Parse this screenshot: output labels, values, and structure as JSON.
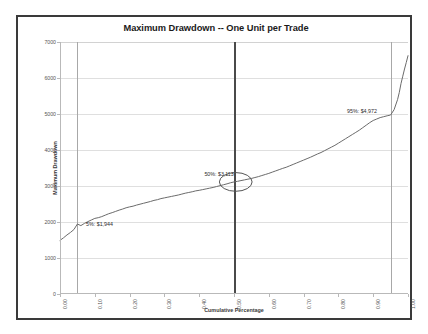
{
  "chart_data": {
    "type": "line",
    "title": "Maximum Drawdown -- One Unit per Trade",
    "xlabel": "Cumulative Percentage",
    "ylabel": "Maximum Drawdown",
    "xlim": [
      0.0,
      1.0
    ],
    "ylim": [
      0,
      7000
    ],
    "grid": true,
    "legend": "none",
    "xticks": [
      "0.00",
      "0.10",
      "0.20",
      "0.30",
      "0.40",
      "0.50",
      "0.60",
      "0.70",
      "0.80",
      "0.90",
      "1.00"
    ],
    "xtick_values": [
      0.0,
      0.1,
      0.2,
      0.3,
      0.4,
      0.5,
      0.6,
      0.7,
      0.8,
      0.9,
      1.0
    ],
    "yticks": [
      "0",
      "1000",
      "2000",
      "3000",
      "4000",
      "5000",
      "6000",
      "7000"
    ],
    "ytick_values": [
      0,
      1000,
      2000,
      3000,
      4000,
      5000,
      6000,
      7000
    ],
    "series": [
      {
        "name": "Maximum Drawdown",
        "color": "#6b6b6b",
        "x": [
          0.0,
          0.01,
          0.02,
          0.03,
          0.04,
          0.05,
          0.06,
          0.07,
          0.08,
          0.09,
          0.1,
          0.11,
          0.12,
          0.13,
          0.14,
          0.15,
          0.16,
          0.17,
          0.18,
          0.19,
          0.2,
          0.21,
          0.22,
          0.23,
          0.24,
          0.25,
          0.26,
          0.27,
          0.28,
          0.29,
          0.3,
          0.31,
          0.32,
          0.33,
          0.34,
          0.35,
          0.36,
          0.37,
          0.38,
          0.39,
          0.4,
          0.41,
          0.42,
          0.43,
          0.44,
          0.45,
          0.46,
          0.47,
          0.48,
          0.49,
          0.5,
          0.51,
          0.52,
          0.53,
          0.54,
          0.55,
          0.56,
          0.57,
          0.58,
          0.59,
          0.6,
          0.61,
          0.62,
          0.63,
          0.64,
          0.65,
          0.66,
          0.67,
          0.68,
          0.69,
          0.7,
          0.71,
          0.72,
          0.73,
          0.74,
          0.75,
          0.76,
          0.77,
          0.78,
          0.79,
          0.8,
          0.81,
          0.82,
          0.83,
          0.84,
          0.85,
          0.86,
          0.87,
          0.88,
          0.89,
          0.9,
          0.91,
          0.92,
          0.93,
          0.94,
          0.95,
          0.96,
          0.97,
          0.975,
          0.98,
          0.985,
          0.99,
          0.995,
          1.0
        ],
        "y": [
          1490,
          1560,
          1640,
          1710,
          1790,
          1944,
          1900,
          1960,
          2010,
          2055,
          2100,
          2120,
          2150,
          2190,
          2230,
          2260,
          2295,
          2330,
          2360,
          2395,
          2420,
          2440,
          2470,
          2495,
          2520,
          2545,
          2570,
          2600,
          2620,
          2650,
          2670,
          2690,
          2710,
          2730,
          2750,
          2775,
          2800,
          2820,
          2840,
          2865,
          2880,
          2900,
          2920,
          2940,
          2960,
          2985,
          3010,
          3035,
          3060,
          3090,
          3113,
          3130,
          3150,
          3170,
          3190,
          3210,
          3235,
          3260,
          3290,
          3320,
          3350,
          3385,
          3420,
          3455,
          3490,
          3520,
          3560,
          3600,
          3640,
          3680,
          3720,
          3760,
          3800,
          3845,
          3890,
          3930,
          3980,
          4030,
          4080,
          4130,
          4190,
          4250,
          4310,
          4370,
          4430,
          4490,
          4550,
          4620,
          4690,
          4760,
          4820,
          4860,
          4900,
          4925,
          4950,
          4972,
          5120,
          5400,
          5600,
          5850,
          6050,
          6250,
          6430,
          6620
        ]
      }
    ],
    "reference_lines": [
      {
        "name": "p5-line",
        "x": 0.05,
        "style": "thin",
        "color": "#a8a8a8"
      },
      {
        "name": "p50-line",
        "x": 0.5,
        "style": "thick",
        "color": "#4a4a4a"
      },
      {
        "name": "p95-line",
        "x": 0.95,
        "style": "thin",
        "color": "#a8a8a8"
      }
    ],
    "annotations": [
      {
        "name": "p5-annotation",
        "text": "5%: $1,944",
        "x": 0.075,
        "y": 2030,
        "percentile": 5,
        "value": 1944
      },
      {
        "name": "p50-annotation",
        "text": "50%: $3,113",
        "x": 0.415,
        "y": 3420,
        "percentile": 50,
        "value": 3113
      },
      {
        "name": "p95-annotation",
        "text": "95%: $4,972",
        "x": 0.825,
        "y": 5180,
        "percentile": 95,
        "value": 4972
      }
    ],
    "highlight_ellipse": {
      "name": "median-highlight-ellipse",
      "cx": 0.505,
      "cy": 3113,
      "rx_frac": 0.047,
      "ry_value": 260,
      "color": "#555555"
    }
  }
}
